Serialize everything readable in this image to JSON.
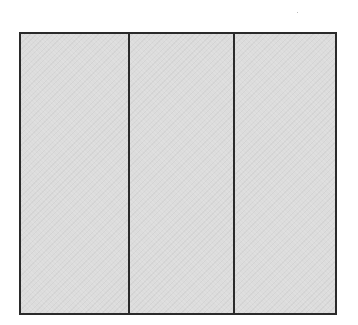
{
  "diagram": {
    "type": "partitioned-rectangle",
    "section_count": 3,
    "sections": [
      {
        "index": 1,
        "label": ""
      },
      {
        "index": 2,
        "label": ""
      },
      {
        "index": 3,
        "label": ""
      }
    ],
    "colors": {
      "fill": "#dcdcdc",
      "stroke": "#2a2a2a",
      "background": "#ffffff"
    }
  }
}
